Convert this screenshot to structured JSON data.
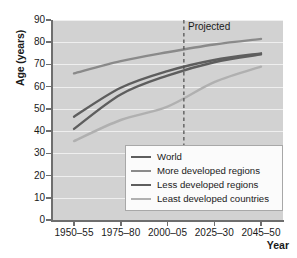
{
  "chart_data": {
    "type": "line",
    "title": "",
    "xlabel": "Year",
    "ylabel": "Age (years)",
    "categories": [
      "1950–55",
      "1975–80",
      "2000–05",
      "2025–30",
      "2045–50"
    ],
    "ylim": [
      0,
      90
    ],
    "ytick_values": [
      0,
      10,
      20,
      30,
      40,
      50,
      60,
      70,
      80,
      90
    ],
    "ytick_labels": [
      "0",
      "10",
      "20",
      "30",
      "40",
      "50",
      "60",
      "70",
      "80",
      "90"
    ],
    "grid": true,
    "legend_position": "lower right",
    "annotations": [
      {
        "text": "Projected",
        "type": "vertical-dashed-line",
        "x_category_fraction": 2.35
      }
    ],
    "series": [
      {
        "name": "World",
        "color": "#5e5e5e",
        "values": [
          46.5,
          59.5,
          67.0,
          72.0,
          75.0
        ]
      },
      {
        "name": "More developed regions",
        "color": "#8a8a8a",
        "values": [
          66.0,
          71.5,
          75.5,
          79.0,
          81.5
        ]
      },
      {
        "name": "Less developed regions",
        "color": "#5e5e5e",
        "values": [
          41.0,
          56.5,
          65.0,
          71.0,
          74.5
        ]
      },
      {
        "name": "Least developed countries",
        "color": "#b0b0b0",
        "values": [
          35.5,
          45.0,
          51.0,
          62.0,
          69.0
        ]
      }
    ]
  },
  "legend": {
    "items": [
      {
        "label": "World"
      },
      {
        "label": "More developed regions"
      },
      {
        "label": "Less developed regions"
      },
      {
        "label": "Least developed countries"
      }
    ]
  }
}
